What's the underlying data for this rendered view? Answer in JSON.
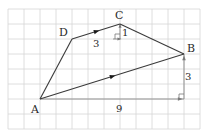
{
  "diagram": {
    "type": "grid-quadrilateral",
    "grid": {
      "columns": 12,
      "rows": 8
    },
    "points": [
      {
        "name": "A",
        "col": 2,
        "row": 6
      },
      {
        "name": "B",
        "col": 11,
        "row": 3
      },
      {
        "name": "C",
        "col": 7,
        "row": 1
      },
      {
        "name": "D",
        "col": 4,
        "row": 2
      }
    ],
    "edges": [
      {
        "from": "A",
        "to": "D",
        "arrow": false
      },
      {
        "from": "D",
        "to": "C",
        "arrow": true
      },
      {
        "from": "C",
        "to": "B",
        "arrow": false
      },
      {
        "from": "A",
        "to": "B",
        "arrow": true
      }
    ],
    "measurements": [
      {
        "label": "9",
        "meaning": "horizontal run A to B"
      },
      {
        "label": "3",
        "meaning": "vertical rise A to B"
      },
      {
        "label": "3",
        "meaning": "horizontal run D to C"
      },
      {
        "label": "1",
        "meaning": "vertical rise D to C"
      }
    ],
    "labels": {
      "A": "A",
      "B": "B",
      "C": "C",
      "D": "D",
      "run_AB": "9",
      "rise_AB": "3",
      "run_DC": "3",
      "rise_DC": "1"
    }
  }
}
